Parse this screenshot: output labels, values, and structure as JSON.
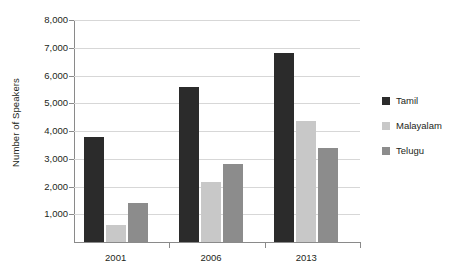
{
  "chart_data": {
    "type": "bar",
    "title": "",
    "xlabel": "",
    "ylabel": "Number of Speakers",
    "categories": [
      "2001",
      "2006",
      "2013"
    ],
    "series": [
      {
        "name": "Tamil",
        "color": "#2b2b2b",
        "values": [
          3800,
          5600,
          6800
        ]
      },
      {
        "name": "Malayalam",
        "color": "#c8c8c8",
        "values": [
          600,
          2150,
          4350
        ]
      },
      {
        "name": "Telugu",
        "color": "#8c8c8c",
        "values": [
          1400,
          2800,
          3400
        ]
      }
    ],
    "ylim": [
      0,
      8000
    ],
    "ytick_step": 1000,
    "ytick_labels": [
      "8,000",
      "7,000",
      "6,000",
      "5,000",
      "4,000",
      "3,000",
      "2,000",
      "1,000"
    ],
    "ytick_values": [
      8000,
      7000,
      6000,
      5000,
      4000,
      3000,
      2000,
      1000
    ],
    "grid": true,
    "legend_position": "right",
    "background_color": "#ffffff",
    "axis_color": "#8a8a8a",
    "gridline_color": "#d7d7d7"
  }
}
